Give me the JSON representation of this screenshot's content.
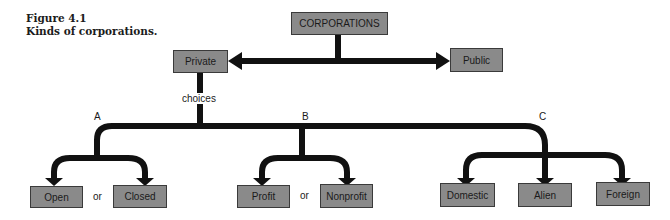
{
  "figure": {
    "number": "Figure 4.1",
    "title": "Kinds of corporations."
  },
  "colors": {
    "box_fill": "#8a8a8a",
    "box_border": "#3a3a3a",
    "connector": "#111111"
  },
  "nodes": {
    "root": "CORPORATIONS",
    "private": "Private",
    "public": "Public",
    "open": "Open",
    "closed": "Closed",
    "profit": "Profit",
    "nonprofit": "Nonprofit",
    "domestic": "Domestic",
    "alien": "Alien",
    "foreign": "Foreign"
  },
  "labels": {
    "choices": "choices",
    "branch_a": "A",
    "branch_b": "B",
    "branch_c": "C",
    "or_a": "or",
    "or_b": "or"
  }
}
